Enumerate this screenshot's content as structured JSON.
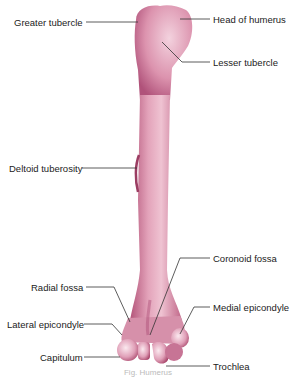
{
  "diagram": {
    "bone_color": "#d98aa6",
    "bone_shadow": "#a8456a",
    "bone_highlight": "#f6dbe5",
    "line_color": "#333333",
    "labels": {
      "greater_tubercle": "Greater tubercle",
      "head_of_humerus": "Head of humerus",
      "lesser_tubercle": "Lesser tubercle",
      "deltoid_tuberosity": "Deltoid tuberosity",
      "coronoid_fossa": "Coronoid fossa",
      "radial_fossa": "Radial fossa",
      "medial_epicondyle": "Medial epicondyle",
      "lateral_epicondyle": "Lateral epicondyle",
      "capitulum": "Capitulum",
      "trochlea": "Trochlea"
    },
    "caption": "Fig. Humerus"
  }
}
